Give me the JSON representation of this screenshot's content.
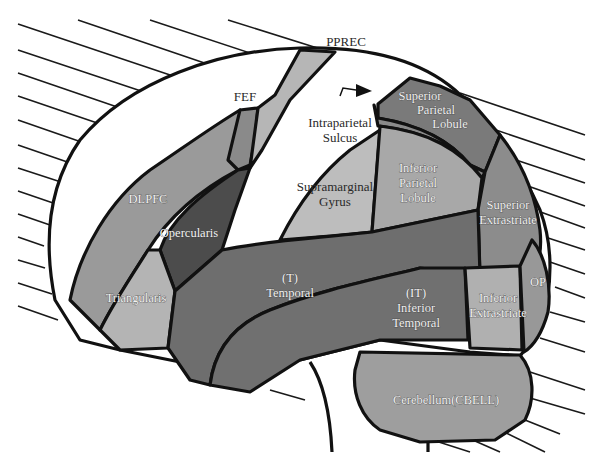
{
  "diagram": {
    "type": "lateral brain region map",
    "colors": {
      "background": "#ffffff",
      "outline": "#111111",
      "hatch": "#1a1a1a",
      "white_strip": "#ffffff",
      "light_gray": "#b8b8b8",
      "mid_gray": "#8f8f8f",
      "dark_gray": "#6e6e6e",
      "darkest_gray": "#4a4a4a"
    },
    "labels": {
      "pprec": "PPREC",
      "fef": "FEF",
      "intraparietal_1": "Intraparietal",
      "intraparietal_2": "Sulcus",
      "superior_parietal_1": "Superior",
      "superior_parietal_2": "Parietal",
      "superior_parietal_3": "Lobule",
      "inferior_parietal_1": "Inferior",
      "inferior_parietal_2": "Parietal",
      "inferior_parietal_3": "Lobule",
      "supramarginal_1": "Supramarginal",
      "supramarginal_2": "Gyrus",
      "dlpfc": "DLPFC",
      "opercularis": "Opercularis",
      "triangularis": "Triangularis",
      "temporal_1": "(T)",
      "temporal_2": "Temporal",
      "inferior_temporal_1": "(IT)",
      "inferior_temporal_2": "Inferior",
      "inferior_temporal_3": "Temporal",
      "superior_extrastriate_1": "Superior",
      "superior_extrastriate_2": "Extrastriate",
      "inferior_extrastriate_1": "Inferior",
      "inferior_extrastriate_2": "Extrastriate",
      "op": "OP",
      "cerebellum": "Cerebellum(CBELL)"
    }
  }
}
